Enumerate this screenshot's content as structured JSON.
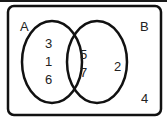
{
  "diagram": {
    "type": "venn",
    "universal_set_elements": [
      "4"
    ],
    "sets": [
      {
        "name": "A",
        "label": "A",
        "only_elements": [
          "3",
          "1",
          "6"
        ]
      },
      {
        "name": "B",
        "label": "B",
        "only_elements": [
          "2"
        ]
      }
    ],
    "intersection_elements": [
      "5",
      "7"
    ],
    "labels": {
      "set_a": "A",
      "set_b": "B",
      "a_only": [
        "3",
        "1",
        "6"
      ],
      "intersection": [
        "5",
        "7"
      ],
      "b_only": [
        "2"
      ],
      "outside": [
        "4"
      ]
    }
  }
}
